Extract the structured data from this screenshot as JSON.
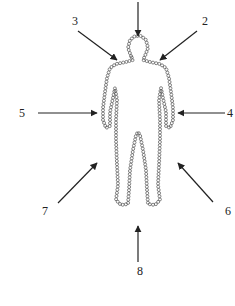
{
  "diagram": {
    "type": "human-figure-with-directional-arrows",
    "figure": {
      "outline_style": "beaded-circles",
      "color": "#555555"
    },
    "arrow_color": "#222222",
    "arrows": [
      {
        "id": "top",
        "label": "",
        "from": [
          138,
          2
        ],
        "to": [
          138,
          36
        ],
        "label_pos": [
          0,
          0
        ]
      },
      {
        "id": "2",
        "label": "2",
        "from": [
          197,
          31
        ],
        "to": [
          160,
          60
        ],
        "label_pos": [
          205,
          25
        ]
      },
      {
        "id": "3",
        "label": "3",
        "from": [
          78,
          31
        ],
        "to": [
          117,
          60
        ],
        "label_pos": [
          75,
          25
        ]
      },
      {
        "id": "4",
        "label": "4",
        "from": [
          225,
          113
        ],
        "to": [
          178,
          113
        ],
        "label_pos": [
          230,
          117
        ]
      },
      {
        "id": "5",
        "label": "5",
        "from": [
          38,
          113
        ],
        "to": [
          97,
          113
        ],
        "label_pos": [
          22,
          117
        ]
      },
      {
        "id": "6",
        "label": "6",
        "from": [
          213,
          202
        ],
        "to": [
          178,
          163
        ],
        "label_pos": [
          228,
          215
        ]
      },
      {
        "id": "7",
        "label": "7",
        "from": [
          58,
          203
        ],
        "to": [
          97,
          163
        ],
        "label_pos": [
          45,
          215
        ]
      },
      {
        "id": "8",
        "label": "8",
        "from": [
          138,
          262
        ],
        "to": [
          138,
          226
        ],
        "label_pos": [
          140,
          275
        ]
      }
    ]
  }
}
